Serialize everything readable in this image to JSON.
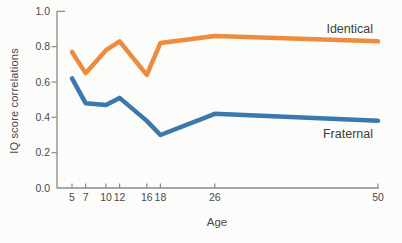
{
  "chart_data": {
    "type": "line",
    "title": "",
    "xlabel": "Age",
    "ylabel": "IQ score correlations",
    "x": [
      5,
      7,
      10,
      12,
      16,
      18,
      26,
      50
    ],
    "x_tick_labels": [
      "5",
      "7",
      "10",
      "12",
      "16",
      "18",
      "26",
      "50"
    ],
    "y_ticks": [
      0.0,
      0.2,
      0.4,
      0.6,
      0.8,
      1.0
    ],
    "y_tick_labels": [
      "0.0",
      "0.2",
      "0.4",
      "0.6",
      "0.8",
      "1.0"
    ],
    "ylim": [
      0.0,
      1.0
    ],
    "xlim": [
      2.8,
      50.3
    ],
    "grid": false,
    "legend_position": "inline-right",
    "axis_color": "#8a8a8a",
    "tick_text_color": "#4a4a4a",
    "series": [
      {
        "name": "Identical",
        "color": "#ED8B3E",
        "values": [
          0.77,
          0.65,
          0.78,
          0.83,
          0.64,
          0.82,
          0.86,
          0.83
        ]
      },
      {
        "name": "Fraternal",
        "color": "#3A78AE",
        "values": [
          0.62,
          0.48,
          0.47,
          0.51,
          0.38,
          0.3,
          0.42,
          0.38
        ]
      }
    ]
  }
}
